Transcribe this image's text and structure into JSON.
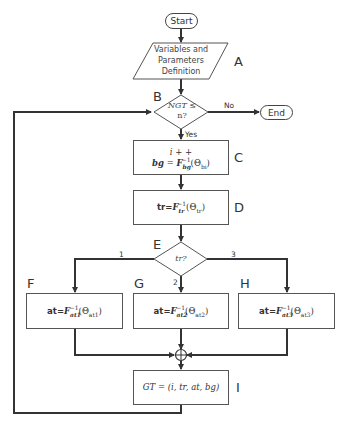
{
  "diagram": {
    "type": "flowchart",
    "nodes": {
      "start": {
        "label": "Start"
      },
      "A": {
        "letter": "A",
        "text_line1": "Variables and",
        "text_line2": "Parameters",
        "text_line3": "Definition"
      },
      "B": {
        "letter": "B",
        "text_line1": "NGT ≤",
        "text_line2": "n?"
      },
      "end": {
        "label": "End"
      },
      "C": {
        "letter": "C",
        "line1": "i + +",
        "lhs": "bg",
        "eq": " = ",
        "func": "F",
        "func_sub": "bg",
        "func_sup": "−1",
        "arg": "(Θ",
        "arg_sub": "bi",
        "arg_close": ")"
      },
      "D": {
        "letter": "D",
        "lhs": "tr=",
        "func": "F",
        "func_sub": "tr",
        "func_sup": "−1",
        "arg": "(Θ",
        "arg_sub": "tr",
        "arg_close": ")"
      },
      "E": {
        "letter": "E",
        "text": "tr?"
      },
      "F": {
        "letter": "F",
        "lhs": "at=",
        "func": "F",
        "func_sub": "at1",
        "func_sup": "−1",
        "arg": "(Θ",
        "arg_sub": "at1",
        "arg_close": ")"
      },
      "G": {
        "letter": "G",
        "lhs": "at=",
        "func": "F",
        "func_sub": "at2",
        "func_sup": "−1",
        "arg": "(Θ",
        "arg_sub": "at2",
        "arg_close": ")"
      },
      "H": {
        "letter": "H",
        "lhs": "at=",
        "func": "F",
        "func_sub": "at3",
        "func_sup": "−1",
        "arg": "(Θ",
        "arg_sub": "at3",
        "arg_close": ")"
      },
      "I": {
        "letter": "I",
        "text": "GT = (i, tr, at, bg)"
      }
    },
    "edge_labels": {
      "no": "No",
      "yes": "Yes",
      "branch1": "1",
      "branch2": "2",
      "branch3": "3"
    },
    "merge_symbol": "⊕",
    "colors": {
      "line": "#333333",
      "box_border": "#555555",
      "background": "#ffffff"
    }
  }
}
